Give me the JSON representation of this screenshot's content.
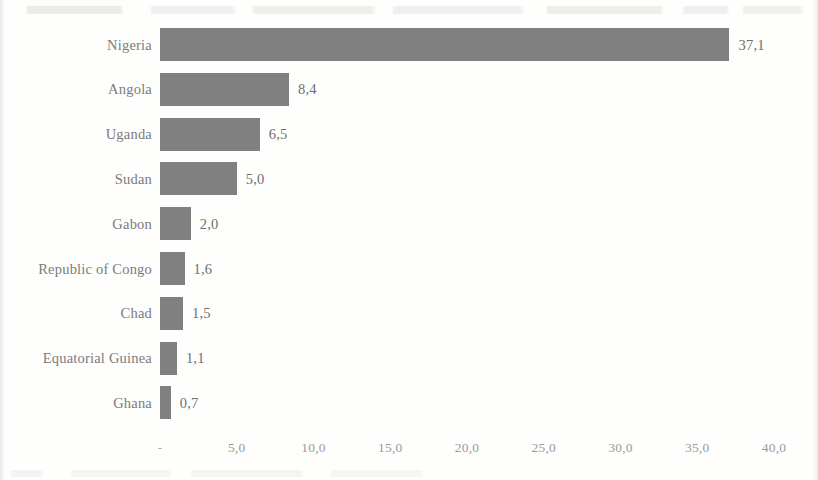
{
  "chart_data": {
    "type": "bar",
    "orientation": "horizontal",
    "title": "",
    "subtitle": "",
    "xlabel": "",
    "ylabel": "",
    "categories": [
      "Nigeria",
      "Angola",
      "Uganda",
      "Sudan",
      "Gabon",
      "Republic of Congo",
      "Chad",
      "Equatorial Guinea",
      "Ghana"
    ],
    "values": [
      37.1,
      8.4,
      6.5,
      5.0,
      2.0,
      1.6,
      1.5,
      1.1,
      0.7
    ],
    "value_labels": [
      "37,1",
      "8,4",
      "6,5",
      "5,0",
      "2,0",
      "1,6",
      "1,5",
      "1,1",
      "0,7"
    ],
    "xlim": [
      0,
      40
    ],
    "x_ticks": [
      0,
      5,
      10,
      15,
      20,
      25,
      30,
      35,
      40
    ],
    "x_tick_labels": [
      "-",
      "5,0",
      "10,0",
      "15,0",
      "20,0",
      "25,0",
      "30,0",
      "35,0",
      "40,0"
    ],
    "grid": false,
    "legend": false,
    "legend_position": "none",
    "decimal_separator": ",",
    "bar_color": "#808080",
    "label_color": "#7b7b7b",
    "tick_color": "#9a9a9a",
    "background_color": "#fefefd"
  }
}
